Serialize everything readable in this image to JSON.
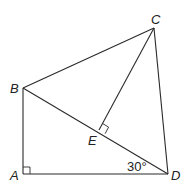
{
  "diagram": {
    "type": "geometry",
    "points": {
      "A": {
        "label": "A",
        "x": 23,
        "y": 174
      },
      "B": {
        "label": "B",
        "x": 23,
        "y": 88
      },
      "C": {
        "label": "C",
        "x": 154,
        "y": 28
      },
      "D": {
        "label": "D",
        "x": 168,
        "y": 174
      },
      "E": {
        "label": "E",
        "x": 99,
        "y": 130
      }
    },
    "segments": [
      "AB",
      "AD",
      "BD",
      "BC",
      "CD",
      "CE"
    ],
    "right_angles": [
      "A",
      "E"
    ],
    "angle_label": {
      "text": "30°",
      "at": "D"
    },
    "labels": {
      "A": "A",
      "B": "B",
      "C": "C",
      "D": "D",
      "E": "E",
      "angle": "30°"
    }
  }
}
